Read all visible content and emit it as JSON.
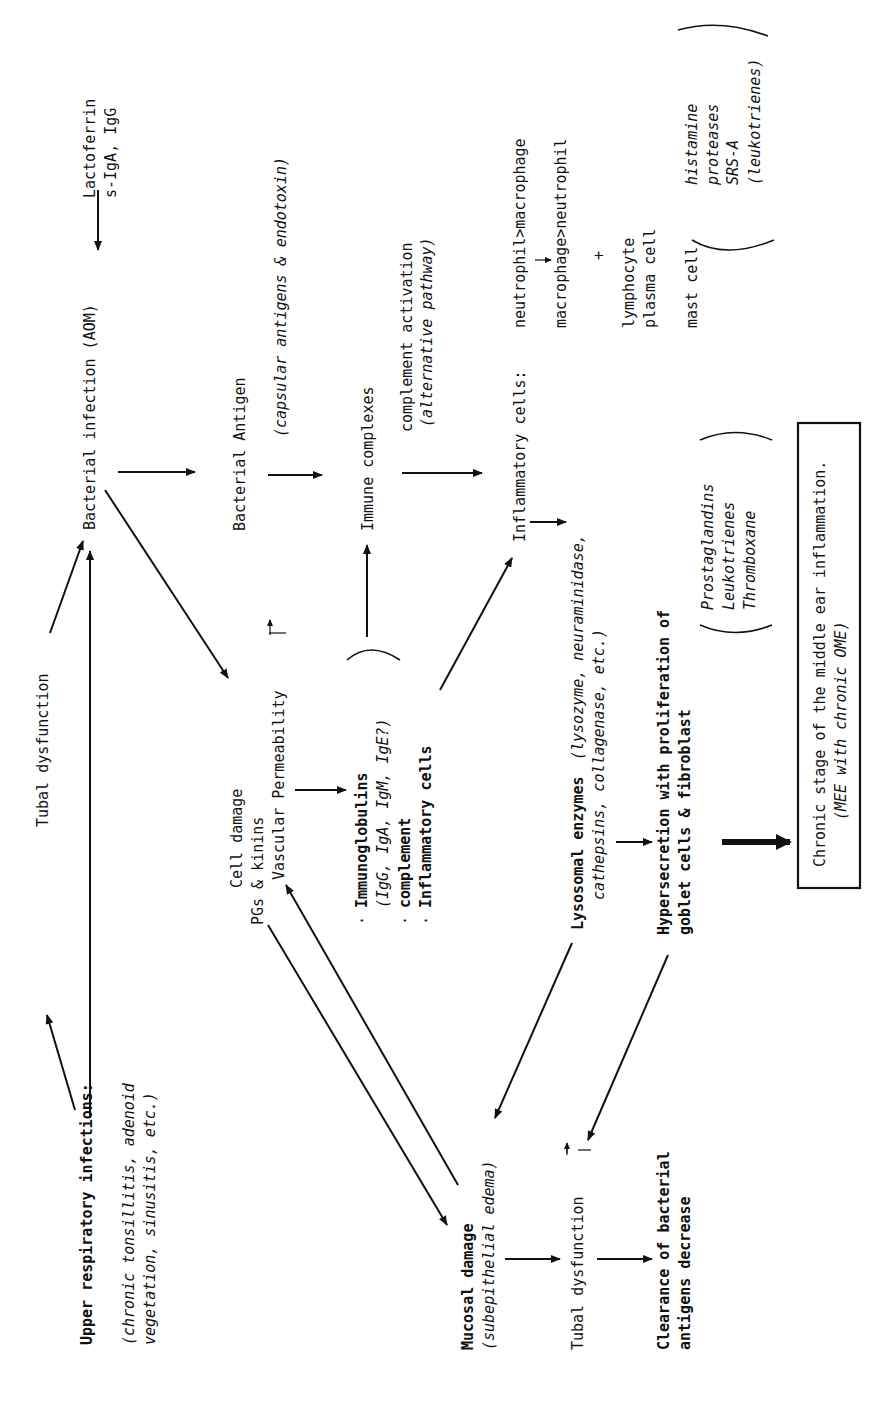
{
  "diagram": {
    "nodes": {
      "upper_resp": {
        "title": "Upper respiratory infections:",
        "sub1": "(chronic tonsillitis, adenoid",
        "sub2": "vegetation, sinusitis, etc.)"
      },
      "tubal_dys_top": {
        "label": "Tubal dysfunction"
      },
      "bacterial_infection": {
        "label": "Bacterial infection (AOM)"
      },
      "lactoferrin": {
        "line1": "Lactoferrin",
        "line2": "s-IgA, IgG"
      },
      "bacterial_antigen": {
        "label": "Bacterial Antigen",
        "sub": "(capsular antigens & endotoxin)"
      },
      "immune_complexes": {
        "label": "Immune complexes"
      },
      "complement_activation": {
        "label": "complement activation",
        "sub": "(alternative pathway)"
      },
      "inflammatory_cells": {
        "label": "Inflammatory cells:",
        "seq1": "neutrophil>macrophage",
        "seq2": "macrophage>neutrophil",
        "plus": "+",
        "lymph1": "lymphocyte",
        "lymph2": "plasma cell",
        "mast": "mast cell"
      },
      "mast_mediators": [
        "histamine",
        "proteases",
        "SRS-A",
        "(leukotrienes)"
      ],
      "cell_damage": {
        "line1": "Cell damage",
        "line2": "PGs & kinins",
        "line3": "Vascular Permeability",
        "up_marker": "↑"
      },
      "exudate": {
        "item1": "Immunoglobulins",
        "item1_sub": "(IgG, IgA, IgM, IgE?)",
        "item2": "complement",
        "item3": "Inflammatory cells",
        "bullet": "·"
      },
      "lysosomal": {
        "label": "Lysosomal enzymes",
        "sub1": "(lysozyme, neuraminidase,",
        "sub2": "cathepsins, collagenase, etc.)"
      },
      "hypersecretion": {
        "line1": "Hypersecretion with proliferation of",
        "line2": "goblet cells & fibroblast"
      },
      "mediators": [
        "Prostaglandins",
        "Leukotrienes",
        "Thromboxane"
      ],
      "chronic_stage": {
        "line1": "Chronic stage of the middle ear inflammation.",
        "line2": "(MEE with chronic OME)"
      },
      "mucosal_damage": {
        "label": "Mucosal damage",
        "sub": "(subepithelial edema)"
      },
      "tubal_dys_bottom": {
        "label": "Tubal dysfunction",
        "up_marker": "↑"
      },
      "clearance": {
        "line1": "Clearance of bacterial",
        "line2": "antigens decrease"
      }
    }
  }
}
